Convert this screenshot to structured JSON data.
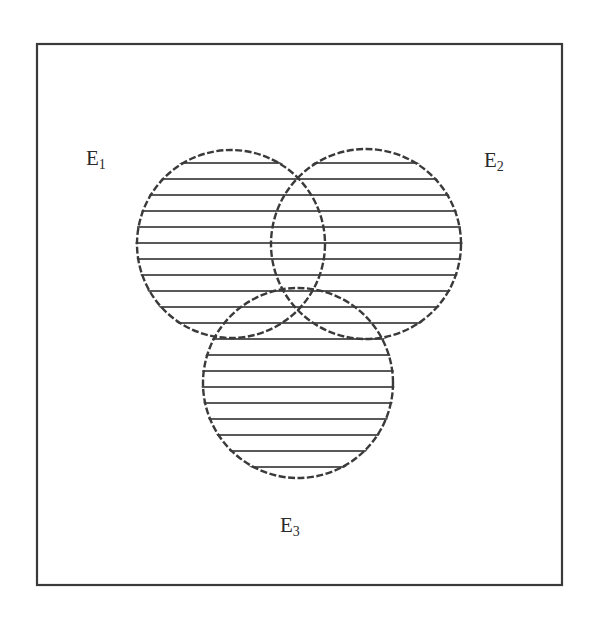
{
  "diagram": {
    "type": "venn",
    "frame": {
      "x": 37,
      "y": 44,
      "width": 525,
      "height": 541,
      "stroke": "#3a3a3a"
    },
    "stroke_color": "#3a3a3a",
    "hatch": {
      "spacing": 16,
      "first_y": 163,
      "last_y": 467,
      "color": "#222222"
    },
    "sets": [
      {
        "id": "E1",
        "base": "E",
        "sub": "1",
        "cx": 231,
        "cy": 244,
        "r": 94,
        "label_x": 86,
        "label_y": 148
      },
      {
        "id": "E2",
        "base": "E",
        "sub": "2",
        "cx": 366,
        "cy": 244,
        "r": 95,
        "label_x": 484,
        "label_y": 150
      },
      {
        "id": "E3",
        "base": "E",
        "sub": "3",
        "cx": 298,
        "cy": 383,
        "r": 95,
        "label_x": 280,
        "label_y": 515
      }
    ],
    "shaded_region": "E1 ∪ E2 ∪ E3"
  }
}
